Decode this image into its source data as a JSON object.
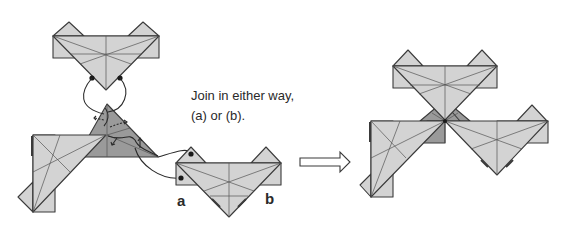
{
  "diagram": {
    "instruction": {
      "line1": "Join in either way,",
      "line2": "(a) or (b)."
    },
    "labels": {
      "a": "a",
      "b": "b"
    },
    "icons": {
      "transition_arrow": "right-hollow-arrow-icon"
    },
    "colors": {
      "paper": "#d3d3d3",
      "paper_dark": "#9a9a9a",
      "outline": "#3a3a3a"
    },
    "figures": [
      {
        "name": "before-joining",
        "units": 3,
        "description": "Two assembled units plus a third unit to be inserted"
      },
      {
        "name": "after-joining",
        "units": 3,
        "description": "Three units joined at a central point"
      }
    ]
  }
}
